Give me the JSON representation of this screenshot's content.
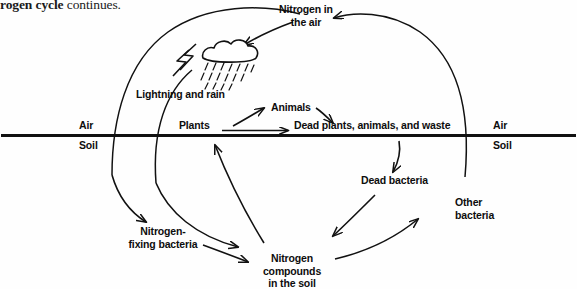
{
  "header": {
    "text_prefix": "rogen cycle",
    "text_suffix": " continues."
  },
  "diagram": {
    "ink_color": "#111111",
    "ground_color": "#111111",
    "labels": {
      "nitrogen_air": "Nitrogen in\nthe air",
      "nitrogen_air_line1": "Nitrogen in",
      "nitrogen_air_line2": "the air",
      "lightning_rain": "Lightning and rain",
      "animals": "Animals",
      "plants": "Plants",
      "dead_matter": "Dead plants, animals, and waste",
      "air_left": "Air",
      "soil_left": "Soil",
      "air_right": "Air",
      "soil_right": "Soil",
      "dead_bacteria": "Dead bacteria",
      "other_bacteria_line1": "Other",
      "other_bacteria_line2": "bacteria",
      "nitrogen_fixing_line1": "Nitrogen-",
      "nitrogen_fixing_line2": "fixing bacteria",
      "nitrogen_compounds_line1": "Nitrogen",
      "nitrogen_compounds_line2": "compounds",
      "nitrogen_compounds_line3": "in the soil"
    },
    "icons": {
      "cloud": "cloud-icon",
      "rain": "rain-icon",
      "lightning": "lightning-bolt-icon"
    }
  }
}
